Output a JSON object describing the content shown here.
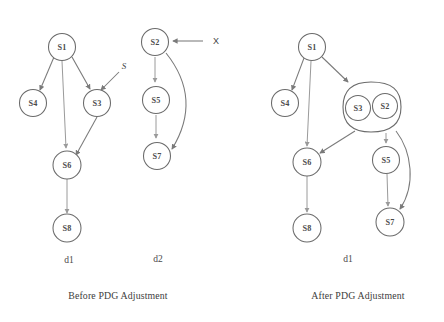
{
  "figure": {
    "background_color": "#ffffff",
    "stroke_color": "#6b6b6b",
    "text_color": "#3c3c3c",
    "panels": [
      {
        "id": "before",
        "caption": "Before PDG Adjustment",
        "graphs": [
          {
            "name": "d1",
            "nodes": [
              "S1",
              "S4",
              "S3",
              "S6",
              "S8"
            ],
            "edges": [
              {
                "from": "S1",
                "to": "S4"
              },
              {
                "from": "S1",
                "to": "S6"
              },
              {
                "from": "S1",
                "to": "S3"
              },
              {
                "from": "S",
                "to": "S3"
              },
              {
                "from": "S3",
                "to": "S6"
              },
              {
                "from": "S6",
                "to": "S8"
              }
            ],
            "external_label": "S"
          },
          {
            "name": "d2",
            "nodes": [
              "S2",
              "S5",
              "S7"
            ],
            "edges": [
              {
                "from": "X",
                "to": "S2"
              },
              {
                "from": "S2",
                "to": "S5"
              },
              {
                "from": "S2",
                "to": "S7"
              },
              {
                "from": "S5",
                "to": "S7"
              }
            ],
            "external_label": "X"
          }
        ]
      },
      {
        "id": "after",
        "caption": "After PDG Adjustment",
        "graphs": [
          {
            "name": "d1",
            "nodes": [
              "S1",
              "S4",
              "S3",
              "S2",
              "S6",
              "S5",
              "S8",
              "S7"
            ],
            "merged_group": [
              "S3",
              "S2"
            ],
            "edges": [
              {
                "from": "S1",
                "to": "S4"
              },
              {
                "from": "S1",
                "to": "S6"
              },
              {
                "from": "S1",
                "to": "S3S2"
              },
              {
                "from": "S3S2",
                "to": "S6"
              },
              {
                "from": "S3S2",
                "to": "S5"
              },
              {
                "from": "S3S2",
                "to": "S7"
              },
              {
                "from": "S6",
                "to": "S8"
              },
              {
                "from": "S5",
                "to": "S7"
              }
            ]
          }
        ]
      }
    ]
  },
  "labels": {
    "n_s1_left": "S1",
    "n_s4_left": "S4",
    "n_s3_left": "S3",
    "n_s6_left": "S6",
    "n_s8_left": "S8",
    "n_s2_mid": "S2",
    "n_s5_mid": "S5",
    "n_s7_mid": "S7",
    "ext_s": "S",
    "ext_x": "X",
    "graph_d1_left": "d1",
    "graph_d2_mid": "d2",
    "caption_before": "Before PDG Adjustment",
    "n_s1_right": "S1",
    "n_s4_right": "S4",
    "n_s3_right": "S3",
    "n_s2_right": "S2",
    "n_s6_right": "S6",
    "n_s5_right": "S5",
    "n_s8_right": "S8",
    "n_s7_right": "S7",
    "graph_d1_right": "d1",
    "caption_after": "After PDG Adjustment"
  }
}
